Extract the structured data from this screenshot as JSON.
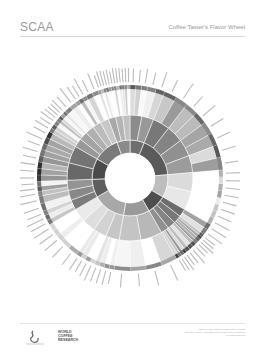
{
  "header": {
    "brand": "SCAA",
    "title": "Coffee Taster's Flavor Wheel"
  },
  "footer": {
    "logo_left": "SCAA logo",
    "logo_right_lines": [
      "WORLD",
      "COFFEE",
      "RESEARCH"
    ],
    "fine_print": [
      "Official Coffee Taster's Flavor Wheel credits",
      "Specialty Coffee Association and World Coffee Research",
      "all rights reserved"
    ]
  },
  "chart_data": {
    "type": "sunburst",
    "title": "Coffee Taster's Flavor Wheel",
    "colors": "grayscale",
    "center": [
      130,
      178
    ],
    "rings": {
      "hole": 25,
      "inner": 38,
      "middle": 63,
      "outer": 93,
      "ticks": 108
    },
    "categories": [
      {
        "name": "Floral",
        "start": 0,
        "end": 22,
        "shade": "#6e6e6e",
        "children": [
          "Black Tea",
          "Floral"
        ]
      },
      {
        "name": "Fruity",
        "start": 22,
        "end": 85,
        "shade": "#5a5a5a",
        "children": [
          "Berry",
          "Dried Fruit",
          "Other Fruit",
          "Citrus Fruit"
        ]
      },
      {
        "name": "Sour/Fermented",
        "start": 85,
        "end": 120,
        "shade": "#bdbdbd",
        "children": [
          "Sour",
          "Alcohol/Fermented"
        ]
      },
      {
        "name": "Green/Vegetative",
        "start": 120,
        "end": 150,
        "shade": "#4e4e4e",
        "children": [
          "Olive Oil",
          "Raw",
          "Green/Vegetative",
          "Beany"
        ]
      },
      {
        "name": "Other",
        "start": 150,
        "end": 190,
        "shade": "#9a9a9a",
        "children": [
          "Papery/Musty",
          "Chemical"
        ]
      },
      {
        "name": "Roasted",
        "start": 190,
        "end": 240,
        "shade": "#a8a8a8",
        "children": [
          "Pipe Tobacco",
          "Tobacco",
          "Burnt",
          "Cereal"
        ]
      },
      {
        "name": "Spices",
        "start": 240,
        "end": 268,
        "shade": "#5e5e5e",
        "children": [
          "Pungent",
          "Pepper",
          "Brown Spice"
        ]
      },
      {
        "name": "Nutty/Cocoa",
        "start": 268,
        "end": 300,
        "shade": "#4a4a4a",
        "children": [
          "Nutty",
          "Cocoa"
        ]
      },
      {
        "name": "Sweet",
        "start": 300,
        "end": 340,
        "shade": "#7a7a7a",
        "children": [
          "Brown Sugar",
          "Vanilla",
          "Vanillin",
          "Overall Sweet",
          "Sweet Aromatics"
        ]
      },
      {
        "name": "Floral ",
        "start": 340,
        "end": 360,
        "shade": "#8a8a8a",
        "children": [
          "Chamomile",
          "Rose",
          "Jasmine"
        ]
      }
    ]
  }
}
